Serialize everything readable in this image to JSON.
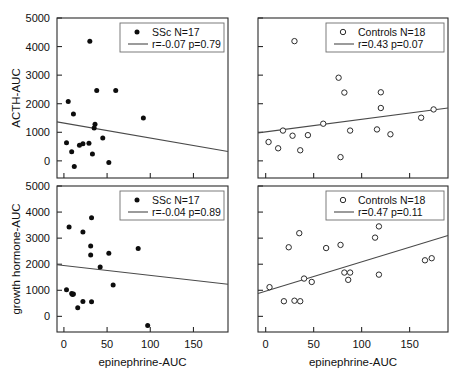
{
  "figure": {
    "xlabel": "epinephrine-AUC",
    "ylabel_top": "ACTH-AUC",
    "ylabel_bottom": "growth hormone-AUC",
    "xticks": [
      "0",
      "50",
      "100",
      "150"
    ],
    "yticks": [
      "0",
      "1000",
      "2000",
      "3000",
      "4000",
      "5000"
    ],
    "line_color": "#4a4a4a",
    "marker_filled_color": "#0d0d0d",
    "marker_open_color": "#ffffff"
  },
  "chart_data": [
    {
      "type": "scatter",
      "panel": "top-left",
      "title": "",
      "xlabel": "epinephrine-AUC",
      "ylabel": "ACTH-AUC",
      "xlim": [
        -8,
        190
      ],
      "ylim": [
        -600,
        5000
      ],
      "grid": false,
      "legend_position": "top-right",
      "marker": "filled-circle",
      "legend": {
        "group_label": "SSc N=17",
        "stat_label": "r=-0.07 p=0.79"
      },
      "annotations": {
        "r": -0.07,
        "p": 0.79,
        "n": 17
      },
      "fit_line": {
        "x": [
          -8,
          190
        ],
        "y": [
          1365,
          330
        ]
      },
      "points": [
        {
          "x": 30,
          "y": 4190
        },
        {
          "x": 38,
          "y": 2460
        },
        {
          "x": 60,
          "y": 2460
        },
        {
          "x": 5,
          "y": 2080
        },
        {
          "x": 11,
          "y": 1640
        },
        {
          "x": 92,
          "y": 1500
        },
        {
          "x": 36,
          "y": 1280
        },
        {
          "x": 35,
          "y": 1150
        },
        {
          "x": 45,
          "y": 800
        },
        {
          "x": 3,
          "y": 630
        },
        {
          "x": 22,
          "y": 600
        },
        {
          "x": 29,
          "y": 620
        },
        {
          "x": 18,
          "y": 550
        },
        {
          "x": 9,
          "y": 320
        },
        {
          "x": 33,
          "y": 240
        },
        {
          "x": 52,
          "y": -60
        },
        {
          "x": 12,
          "y": -200
        }
      ]
    },
    {
      "type": "scatter",
      "panel": "top-right",
      "title": "",
      "xlabel": "epinephrine-AUC",
      "ylabel": "ACTH-AUC",
      "xlim": [
        -8,
        190
      ],
      "ylim": [
        -600,
        5000
      ],
      "grid": false,
      "legend_position": "top-right",
      "marker": "open-circle",
      "legend": {
        "group_label": "Controls N=18",
        "stat_label": "r=0.43 p=0.07"
      },
      "annotations": {
        "r": 0.43,
        "p": 0.07,
        "n": 18
      },
      "fit_line": {
        "x": [
          -8,
          190
        ],
        "y": [
          980,
          1850
        ]
      },
      "points": [
        {
          "x": 30,
          "y": 4190
        },
        {
          "x": 76,
          "y": 2910
        },
        {
          "x": 82,
          "y": 2390
        },
        {
          "x": 120,
          "y": 2400
        },
        {
          "x": 120,
          "y": 1850
        },
        {
          "x": 175,
          "y": 1800
        },
        {
          "x": 162,
          "y": 1510
        },
        {
          "x": 60,
          "y": 1300
        },
        {
          "x": 18,
          "y": 1060
        },
        {
          "x": 88,
          "y": 1060
        },
        {
          "x": 116,
          "y": 1100
        },
        {
          "x": 130,
          "y": 930
        },
        {
          "x": 28,
          "y": 880
        },
        {
          "x": 44,
          "y": 900
        },
        {
          "x": 3,
          "y": 660
        },
        {
          "x": 13,
          "y": 440
        },
        {
          "x": 36,
          "y": 370
        },
        {
          "x": 78,
          "y": 130
        }
      ]
    },
    {
      "type": "scatter",
      "panel": "bottom-left",
      "title": "",
      "xlabel": "epinephrine-AUC",
      "ylabel": "growth hormone-AUC",
      "xlim": [
        -8,
        190
      ],
      "ylim": [
        -600,
        5000
      ],
      "grid": false,
      "legend_position": "top-right",
      "marker": "filled-circle",
      "legend": {
        "group_label": "SSc N=17",
        "stat_label": "r=-0.04 p=0.89"
      },
      "annotations": {
        "r": -0.04,
        "p": 0.89,
        "n": 17
      },
      "fit_line": {
        "x": [
          -8,
          190
        ],
        "y": [
          1980,
          1230
        ]
      },
      "points": [
        {
          "x": 32,
          "y": 3780
        },
        {
          "x": 6,
          "y": 3430
        },
        {
          "x": 22,
          "y": 3240
        },
        {
          "x": 31,
          "y": 2700
        },
        {
          "x": 86,
          "y": 2600
        },
        {
          "x": 31,
          "y": 2350
        },
        {
          "x": 52,
          "y": 2420
        },
        {
          "x": 42,
          "y": 1890
        },
        {
          "x": 57,
          "y": 1200
        },
        {
          "x": 3,
          "y": 1020
        },
        {
          "x": 9,
          "y": 880
        },
        {
          "x": 10,
          "y": 840
        },
        {
          "x": 22,
          "y": 570
        },
        {
          "x": 32,
          "y": 560
        },
        {
          "x": 16,
          "y": 330
        },
        {
          "x": 97,
          "y": -350
        },
        {
          "x": 11,
          "y": 860
        }
      ]
    },
    {
      "type": "scatter",
      "panel": "bottom-right",
      "title": "",
      "xlabel": "epinephrine-AUC",
      "ylabel": "growth hormone-AUC",
      "xlim": [
        -8,
        190
      ],
      "ylim": [
        -600,
        5000
      ],
      "grid": false,
      "legend_position": "top-right",
      "marker": "open-circle",
      "legend": {
        "group_label": "Controls N=18",
        "stat_label": "r=0.47 p=0.11"
      },
      "annotations": {
        "r": 0.47,
        "p": 0.11,
        "n": 18
      },
      "fit_line": {
        "x": [
          -8,
          190
        ],
        "y": [
          880,
          3100
        ]
      },
      "points": [
        {
          "x": 118,
          "y": 3450
        },
        {
          "x": 35,
          "y": 3190
        },
        {
          "x": 114,
          "y": 3020
        },
        {
          "x": 78,
          "y": 2740
        },
        {
          "x": 63,
          "y": 2620
        },
        {
          "x": 24,
          "y": 2650
        },
        {
          "x": 166,
          "y": 2150
        },
        {
          "x": 173,
          "y": 2230
        },
        {
          "x": 82,
          "y": 1680
        },
        {
          "x": 88,
          "y": 1680
        },
        {
          "x": 118,
          "y": 1600
        },
        {
          "x": 86,
          "y": 1400
        },
        {
          "x": 40,
          "y": 1450
        },
        {
          "x": 48,
          "y": 1320
        },
        {
          "x": 4,
          "y": 1120
        },
        {
          "x": 19,
          "y": 580
        },
        {
          "x": 36,
          "y": 580
        },
        {
          "x": 30,
          "y": 600
        }
      ]
    }
  ]
}
